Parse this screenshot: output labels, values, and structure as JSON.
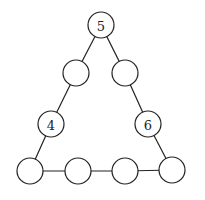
{
  "diagram": {
    "type": "number-triangle-puzzle",
    "stroke_color": "#222222",
    "background": "#ffffff",
    "radius": 13,
    "nodes": [
      {
        "id": "top",
        "x": 101,
        "y": 25,
        "label": "5"
      },
      {
        "id": "left-upper",
        "x": 76,
        "y": 73,
        "label": ""
      },
      {
        "id": "right-upper",
        "x": 125,
        "y": 73,
        "label": ""
      },
      {
        "id": "left-lower",
        "x": 51,
        "y": 124,
        "label": "4"
      },
      {
        "id": "right-lower",
        "x": 148,
        "y": 124,
        "label": "6"
      },
      {
        "id": "bottom-1",
        "x": 30,
        "y": 171,
        "label": ""
      },
      {
        "id": "bottom-2",
        "x": 78,
        "y": 171,
        "label": ""
      },
      {
        "id": "bottom-3",
        "x": 125,
        "y": 171,
        "label": ""
      },
      {
        "id": "bottom-4",
        "x": 172,
        "y": 170,
        "label": ""
      }
    ],
    "edges": [
      [
        "top",
        "left-upper"
      ],
      [
        "left-upper",
        "left-lower"
      ],
      [
        "left-lower",
        "bottom-1"
      ],
      [
        "top",
        "right-upper"
      ],
      [
        "right-upper",
        "right-lower"
      ],
      [
        "right-lower",
        "bottom-4"
      ],
      [
        "bottom-1",
        "bottom-2"
      ],
      [
        "bottom-2",
        "bottom-3"
      ],
      [
        "bottom-3",
        "bottom-4"
      ]
    ]
  }
}
